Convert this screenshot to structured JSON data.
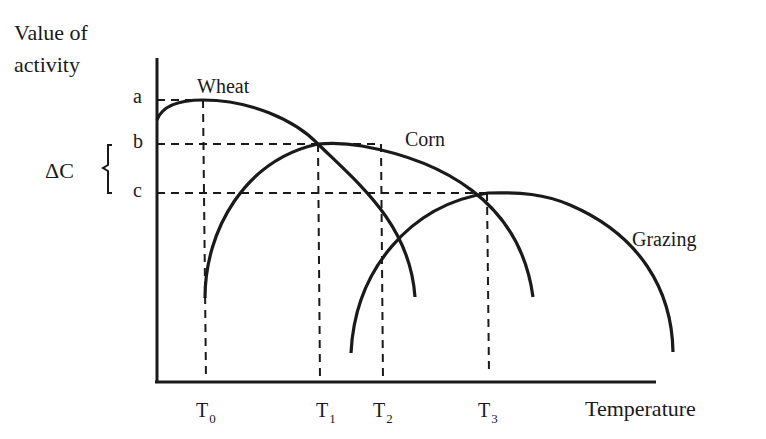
{
  "diagram": {
    "y_axis_label_line1": "Value of",
    "y_axis_label_line2": "activity",
    "x_axis_label": "Temperature",
    "y_ticks": [
      {
        "label": "a",
        "y": 100
      },
      {
        "label": "b",
        "y": 144
      },
      {
        "label": "c",
        "y": 193
      }
    ],
    "x_ticks": [
      {
        "label": "T",
        "sub": "0",
        "x": 203
      },
      {
        "label": "T",
        "sub": "1",
        "x": 318
      },
      {
        "label": "T",
        "sub": "2",
        "x": 381
      },
      {
        "label": "T",
        "sub": "3",
        "x": 488
      }
    ],
    "delta_label": "ΔC",
    "brace": "{",
    "curves": [
      {
        "name": "Wheat",
        "peak_tick": "T0",
        "peak_value": "a"
      },
      {
        "name": "Corn",
        "peak_tick": "T1",
        "peak_value": "b"
      },
      {
        "name": "Grazing",
        "peak_tick": "T3",
        "peak_value": "c"
      }
    ],
    "line_color": "#1a1a1a",
    "background": "#ffffff"
  }
}
